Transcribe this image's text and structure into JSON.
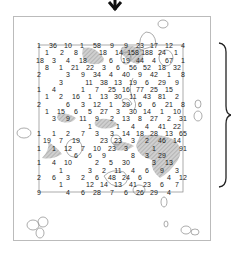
{
  "colors": {
    "frame": "#bbbbbb",
    "grid_line": "#888888",
    "hatch": "#b0b0b0",
    "blob": "#888888",
    "text": "#222222",
    "arrow": "#111111",
    "brace": "#222222"
  },
  "arrow": {
    "direction": "down",
    "x": 115,
    "y": 8
  },
  "brace": {
    "side": "right",
    "x": 220,
    "y_top": 43,
    "y_bottom": 187
  },
  "grid": {
    "left": 39,
    "top": 45,
    "right": 184,
    "bottom": 192
  },
  "numbers": [
    {
      "v": "1",
      "x": 39,
      "y": 45
    },
    {
      "v": "36",
      "x": 53,
      "y": 45
    },
    {
      "v": "10",
      "x": 68,
      "y": 45
    },
    {
      "v": "1",
      "x": 82,
      "y": 45
    },
    {
      "v": "58",
      "x": 97,
      "y": 45
    },
    {
      "v": "9",
      "x": 112,
      "y": 45
    },
    {
      "v": "9",
      "x": 126,
      "y": 45
    },
    {
      "v": "23",
      "x": 140,
      "y": 45
    },
    {
      "v": "17",
      "x": 154,
      "y": 45
    },
    {
      "v": "12",
      "x": 169,
      "y": 45
    },
    {
      "v": "4",
      "x": 183,
      "y": 45
    },
    {
      "v": "1",
      "x": 47,
      "y": 52
    },
    {
      "v": "2",
      "x": 62,
      "y": 52
    },
    {
      "v": "8",
      "x": 76,
      "y": 52
    },
    {
      "v": "18",
      "x": 103,
      "y": 52
    },
    {
      "v": "14",
      "x": 119,
      "y": 52
    },
    {
      "v": "158",
      "x": 133,
      "y": 52
    },
    {
      "v": "188",
      "x": 147,
      "y": 52
    },
    {
      "v": "24",
      "x": 162,
      "y": 52
    },
    {
      "v": "1",
      "x": 176,
      "y": 52
    },
    {
      "v": "18",
      "x": 40,
      "y": 60
    },
    {
      "v": "3",
      "x": 54,
      "y": 60
    },
    {
      "v": "4",
      "x": 68,
      "y": 60
    },
    {
      "v": "18",
      "x": 83,
      "y": 60
    },
    {
      "v": "6",
      "x": 111,
      "y": 60
    },
    {
      "v": "19",
      "x": 126,
      "y": 60
    },
    {
      "v": "44",
      "x": 140,
      "y": 60
    },
    {
      "v": "4",
      "x": 154,
      "y": 60
    },
    {
      "v": "67",
      "x": 169,
      "y": 60
    },
    {
      "v": "1",
      "x": 183,
      "y": 60
    },
    {
      "v": "8",
      "x": 47,
      "y": 67
    },
    {
      "v": "1",
      "x": 61,
      "y": 67
    },
    {
      "v": "21",
      "x": 75,
      "y": 67
    },
    {
      "v": "22",
      "x": 90,
      "y": 67
    },
    {
      "v": "3",
      "x": 104,
      "y": 67
    },
    {
      "v": "6",
      "x": 118,
      "y": 67
    },
    {
      "v": "56",
      "x": 133,
      "y": 67
    },
    {
      "v": "52",
      "x": 147,
      "y": 67
    },
    {
      "v": "18",
      "x": 162,
      "y": 67
    },
    {
      "v": "32",
      "x": 177,
      "y": 67
    },
    {
      "v": "2",
      "x": 39,
      "y": 74
    },
    {
      "v": "3",
      "x": 68,
      "y": 74
    },
    {
      "v": "9",
      "x": 83,
      "y": 74
    },
    {
      "v": "34",
      "x": 97,
      "y": 74
    },
    {
      "v": "4",
      "x": 111,
      "y": 74
    },
    {
      "v": "40",
      "x": 126,
      "y": 74
    },
    {
      "v": "9",
      "x": 140,
      "y": 74
    },
    {
      "v": "42",
      "x": 154,
      "y": 74
    },
    {
      "v": "1",
      "x": 169,
      "y": 74
    },
    {
      "v": "8",
      "x": 183,
      "y": 74
    },
    {
      "v": "3",
      "x": 61,
      "y": 82
    },
    {
      "v": "11",
      "x": 89,
      "y": 82
    },
    {
      "v": "38",
      "x": 104,
      "y": 82
    },
    {
      "v": "13",
      "x": 118,
      "y": 82
    },
    {
      "v": "19",
      "x": 133,
      "y": 82
    },
    {
      "v": "6",
      "x": 147,
      "y": 82
    },
    {
      "v": "29",
      "x": 162,
      "y": 82
    },
    {
      "v": "9",
      "x": 177,
      "y": 82
    },
    {
      "v": "1",
      "x": 39,
      "y": 89
    },
    {
      "v": "4",
      "x": 54,
      "y": 89
    },
    {
      "v": "1",
      "x": 83,
      "y": 89
    },
    {
      "v": "7",
      "x": 97,
      "y": 89
    },
    {
      "v": "25",
      "x": 112,
      "y": 89
    },
    {
      "v": "16",
      "x": 126,
      "y": 89
    },
    {
      "v": "77",
      "x": 140,
      "y": 89
    },
    {
      "v": "25",
      "x": 154,
      "y": 89
    },
    {
      "v": "15",
      "x": 169,
      "y": 89
    },
    {
      "v": "1",
      "x": 47,
      "y": 96
    },
    {
      "v": "2",
      "x": 61,
      "y": 96
    },
    {
      "v": "16",
      "x": 76,
      "y": 96
    },
    {
      "v": "1",
      "x": 90,
      "y": 96
    },
    {
      "v": "13",
      "x": 104,
      "y": 96
    },
    {
      "v": "30",
      "x": 118,
      "y": 96
    },
    {
      "v": "11",
      "x": 133,
      "y": 96
    },
    {
      "v": "43",
      "x": 147,
      "y": 96
    },
    {
      "v": "81",
      "x": 162,
      "y": 96
    },
    {
      "v": "2",
      "x": 177,
      "y": 96
    },
    {
      "v": "2",
      "x": 39,
      "y": 104
    },
    {
      "v": "6",
      "x": 68,
      "y": 104
    },
    {
      "v": "3",
      "x": 83,
      "y": 104
    },
    {
      "v": "12",
      "x": 97,
      "y": 104
    },
    {
      "v": "1",
      "x": 111,
      "y": 104
    },
    {
      "v": "29",
      "x": 126,
      "y": 104
    },
    {
      "v": "6",
      "x": 140,
      "y": 104
    },
    {
      "v": "6",
      "x": 154,
      "y": 104
    },
    {
      "v": "21",
      "x": 169,
      "y": 104
    },
    {
      "v": "8",
      "x": 183,
      "y": 104
    },
    {
      "v": "1",
      "x": 47,
      "y": 111
    },
    {
      "v": "15",
      "x": 61,
      "y": 111
    },
    {
      "v": "6",
      "x": 76,
      "y": 111
    },
    {
      "v": "5",
      "x": 90,
      "y": 111
    },
    {
      "v": "27",
      "x": 104,
      "y": 111
    },
    {
      "v": "3",
      "x": 118,
      "y": 111
    },
    {
      "v": "30",
      "x": 133,
      "y": 111
    },
    {
      "v": "14",
      "x": 147,
      "y": 111
    },
    {
      "v": "1",
      "x": 162,
      "y": 111
    },
    {
      "v": "10",
      "x": 177,
      "y": 111
    },
    {
      "v": "3",
      "x": 54,
      "y": 118
    },
    {
      "v": "9",
      "x": 68,
      "y": 118
    },
    {
      "v": "11",
      "x": 83,
      "y": 118
    },
    {
      "v": "9",
      "x": 97,
      "y": 118
    },
    {
      "v": "2",
      "x": 112,
      "y": 118
    },
    {
      "v": "13",
      "x": 126,
      "y": 118
    },
    {
      "v": "8",
      "x": 140,
      "y": 118
    },
    {
      "v": "27",
      "x": 154,
      "y": 118
    },
    {
      "v": "2",
      "x": 169,
      "y": 118
    },
    {
      "v": "31",
      "x": 183,
      "y": 118
    },
    {
      "v": "1",
      "x": 90,
      "y": 126
    },
    {
      "v": "1",
      "x": 118,
      "y": 126
    },
    {
      "v": "4",
      "x": 133,
      "y": 126
    },
    {
      "v": "4",
      "x": 147,
      "y": 126
    },
    {
      "v": "41",
      "x": 162,
      "y": 126
    },
    {
      "v": "22",
      "x": 177,
      "y": 126
    },
    {
      "v": "1",
      "x": 39,
      "y": 133
    },
    {
      "v": "1",
      "x": 54,
      "y": 133
    },
    {
      "v": "2",
      "x": 68,
      "y": 133
    },
    {
      "v": "7",
      "x": 83,
      "y": 133
    },
    {
      "v": "3",
      "x": 97,
      "y": 133
    },
    {
      "v": "3",
      "x": 112,
      "y": 133
    },
    {
      "v": "14",
      "x": 126,
      "y": 133
    },
    {
      "v": "18",
      "x": 140,
      "y": 133
    },
    {
      "v": "28",
      "x": 154,
      "y": 133
    },
    {
      "v": "13",
      "x": 169,
      "y": 133
    },
    {
      "v": "65",
      "x": 183,
      "y": 133
    },
    {
      "v": "19",
      "x": 47,
      "y": 140
    },
    {
      "v": "7",
      "x": 61,
      "y": 140
    },
    {
      "v": "19",
      "x": 76,
      "y": 140
    },
    {
      "v": "23",
      "x": 104,
      "y": 140
    },
    {
      "v": "23",
      "x": 118,
      "y": 140
    },
    {
      "v": "3",
      "x": 133,
      "y": 140
    },
    {
      "v": "2",
      "x": 147,
      "y": 140
    },
    {
      "v": "46",
      "x": 162,
      "y": 140
    },
    {
      "v": "14",
      "x": 177,
      "y": 140
    },
    {
      "v": "1",
      "x": 39,
      "y": 148
    },
    {
      "v": "1",
      "x": 54,
      "y": 148
    },
    {
      "v": "12",
      "x": 68,
      "y": 148
    },
    {
      "v": "7",
      "x": 83,
      "y": 148
    },
    {
      "v": "10",
      "x": 97,
      "y": 148
    },
    {
      "v": "23",
      "x": 112,
      "y": 148
    },
    {
      "v": "3",
      "x": 126,
      "y": 148
    },
    {
      "v": "1",
      "x": 154,
      "y": 148
    },
    {
      "v": "91",
      "x": 183,
      "y": 148
    },
    {
      "v": "6",
      "x": 76,
      "y": 155
    },
    {
      "v": "6",
      "x": 90,
      "y": 155
    },
    {
      "v": "9",
      "x": 104,
      "y": 155
    },
    {
      "v": "8",
      "x": 133,
      "y": 155
    },
    {
      "v": "3",
      "x": 147,
      "y": 155
    },
    {
      "v": "29",
      "x": 162,
      "y": 155
    },
    {
      "v": "1",
      "x": 39,
      "y": 162
    },
    {
      "v": "4",
      "x": 54,
      "y": 162
    },
    {
      "v": "10",
      "x": 68,
      "y": 162
    },
    {
      "v": "2",
      "x": 97,
      "y": 162
    },
    {
      "v": "5",
      "x": 111,
      "y": 162
    },
    {
      "v": "30",
      "x": 126,
      "y": 162
    },
    {
      "v": "3",
      "x": 154,
      "y": 162
    },
    {
      "v": "13",
      "x": 169,
      "y": 162
    },
    {
      "v": "1",
      "x": 61,
      "y": 170
    },
    {
      "v": "3",
      "x": 90,
      "y": 170
    },
    {
      "v": "2",
      "x": 104,
      "y": 170
    },
    {
      "v": "11",
      "x": 118,
      "y": 170
    },
    {
      "v": "4",
      "x": 133,
      "y": 170
    },
    {
      "v": "6",
      "x": 147,
      "y": 170
    },
    {
      "v": "9",
      "x": 162,
      "y": 170
    },
    {
      "v": "3",
      "x": 177,
      "y": 170
    },
    {
      "v": "2",
      "x": 39,
      "y": 177
    },
    {
      "v": "6",
      "x": 54,
      "y": 177
    },
    {
      "v": "3",
      "x": 68,
      "y": 177
    },
    {
      "v": "2",
      "x": 83,
      "y": 177
    },
    {
      "v": "6",
      "x": 97,
      "y": 177
    },
    {
      "v": "48",
      "x": 112,
      "y": 177
    },
    {
      "v": "24",
      "x": 126,
      "y": 177
    },
    {
      "v": "6",
      "x": 140,
      "y": 177
    },
    {
      "v": "4",
      "x": 169,
      "y": 177
    },
    {
      "v": "12",
      "x": 183,
      "y": 177
    },
    {
      "v": "1",
      "x": 61,
      "y": 184
    },
    {
      "v": "12",
      "x": 90,
      "y": 184
    },
    {
      "v": "14",
      "x": 104,
      "y": 184
    },
    {
      "v": "13",
      "x": 118,
      "y": 184
    },
    {
      "v": "41",
      "x": 133,
      "y": 184
    },
    {
      "v": "23",
      "x": 147,
      "y": 184
    },
    {
      "v": "6",
      "x": 162,
      "y": 184
    },
    {
      "v": "7",
      "x": 177,
      "y": 184
    },
    {
      "v": "9",
      "x": 39,
      "y": 192
    },
    {
      "v": "4",
      "x": 68,
      "y": 192
    },
    {
      "v": "6",
      "x": 83,
      "y": 192
    },
    {
      "v": "28",
      "x": 97,
      "y": 192
    },
    {
      "v": "7",
      "x": 112,
      "y": 192
    },
    {
      "v": "6",
      "x": 126,
      "y": 192
    },
    {
      "v": "26",
      "x": 140,
      "y": 192
    },
    {
      "v": "29",
      "x": 154,
      "y": 192
    },
    {
      "v": "4",
      "x": 169,
      "y": 192
    }
  ]
}
